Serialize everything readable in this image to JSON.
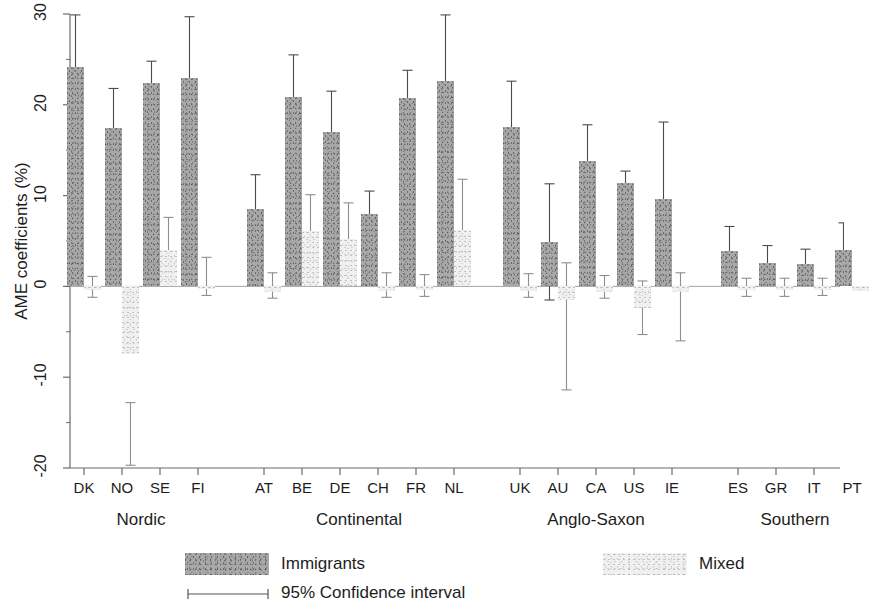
{
  "chart_data": {
    "type": "bar",
    "title": "",
    "xlabel": "",
    "ylabel": "AME coefficients (%)",
    "ylim": [
      -20,
      30
    ],
    "yticks": [
      30,
      20,
      10,
      0,
      -10,
      -20
    ],
    "ytick_labels": [
      "30",
      "20",
      "10",
      "0",
      "-10",
      "-20"
    ],
    "grid": false,
    "legend_position": "bottom",
    "categories": [
      "DK",
      "NO",
      "SE",
      "FI",
      "AT",
      "BE",
      "DE",
      "CH",
      "FR",
      "NL",
      "UK",
      "AU",
      "CA",
      "US",
      "IE",
      "ES",
      "GR",
      "IT",
      "PT"
    ],
    "groups": [
      {
        "label": "Nordic",
        "countries": [
          "DK",
          "NO",
          "SE",
          "FI"
        ]
      },
      {
        "label": "Continental",
        "countries": [
          "AT",
          "BE",
          "DE",
          "CH",
          "FR",
          "NL"
        ]
      },
      {
        "label": "Anglo-Saxon",
        "countries": [
          "UK",
          "AU",
          "CA",
          "US",
          "IE"
        ]
      },
      {
        "label": "Southern",
        "countries": [
          "ES",
          "GR",
          "IT",
          "PT"
        ]
      }
    ],
    "series": [
      {
        "name": "Immigrants",
        "color": "#a8a8a8",
        "values": [
          24.2,
          17.5,
          22.4,
          23.0,
          8.5,
          20.9,
          17.0,
          8.0,
          20.8,
          22.6,
          17.6,
          4.9,
          13.8,
          11.4,
          9.6,
          3.9,
          2.6,
          2.5,
          4.0
        ],
        "ci_low": [
          18.9,
          13.1,
          20.3,
          16.2,
          5.0,
          16.0,
          13.0,
          5.6,
          17.8,
          16.5,
          14.4,
          -1.5,
          10.2,
          10.1,
          1.2,
          1.0,
          0.6,
          0.7,
          0.8
        ],
        "ci_high": [
          29.9,
          21.8,
          24.8,
          29.7,
          12.3,
          25.5,
          21.5,
          10.5,
          23.8,
          29.9,
          22.6,
          11.3,
          17.8,
          12.7,
          18.1,
          6.6,
          4.5,
          4.1,
          7.0
        ]
      },
      {
        "name": "Mixed",
        "color": "#f0f0f0",
        "values": [
          -0.4,
          -7.5,
          4.0,
          -0.3,
          -0.6,
          6.1,
          5.2,
          -0.5,
          -0.4,
          6.2,
          -0.5,
          -1.5,
          -0.6,
          -2.4,
          -0.6,
          -0.4,
          -0.4,
          -0.4,
          -0.5
        ],
        "ci_low": [
          -1.2,
          -19.7,
          0.5,
          -1.0,
          -1.3,
          2.0,
          1.4,
          -1.2,
          -1.1,
          1.1,
          -1.2,
          -11.4,
          -1.3,
          -5.3,
          -6.0,
          -1.1,
          -1.1,
          -1.0,
          -1.2
        ],
        "ci_high": [
          1.1,
          -12.8,
          7.6,
          3.2,
          1.5,
          10.1,
          9.2,
          1.5,
          1.3,
          11.8,
          1.4,
          2.6,
          1.2,
          0.6,
          1.5,
          0.9,
          0.9,
          0.9,
          1.0
        ]
      }
    ],
    "legend": [
      {
        "label": "Immigrants",
        "type": "swatch",
        "color": "#a8a8a8"
      },
      {
        "label": "Mixed",
        "type": "swatch",
        "color": "#f0f0f0"
      },
      {
        "label": "95% Confidence interval",
        "type": "errorbar",
        "color": "#555555"
      }
    ]
  }
}
